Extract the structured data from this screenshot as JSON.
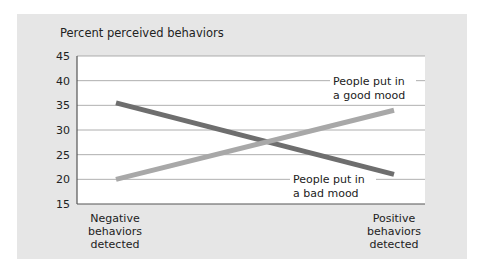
{
  "chart_data": {
    "type": "line",
    "title": "Percent perceived behaviors",
    "xlabel": "",
    "ylabel": "Percent perceived behaviors",
    "categories": [
      "Negative behaviors detected",
      "Positive behaviors detected"
    ],
    "category_lines": [
      [
        "Negative",
        "behaviors",
        "detected"
      ],
      [
        "Positive",
        "behaviors",
        "detected"
      ]
    ],
    "ylim": [
      15,
      45
    ],
    "yticks": [
      15,
      20,
      25,
      30,
      35,
      40,
      45
    ],
    "grid": true,
    "series": [
      {
        "name": "People put in a bad mood",
        "label_lines": [
          "People put in",
          "a bad mood"
        ],
        "values": [
          35.5,
          21
        ],
        "color": "#6e6e6e"
      },
      {
        "name": "People put in a good mood",
        "label_lines": [
          "People put in",
          "a good mood"
        ],
        "values": [
          20,
          34
        ],
        "color": "#a8a8a8"
      }
    ],
    "colors": {
      "panel": "#e6e6e6",
      "plot": "#ffffff",
      "grid": "#9a9a9a",
      "axis": "#555555"
    }
  }
}
